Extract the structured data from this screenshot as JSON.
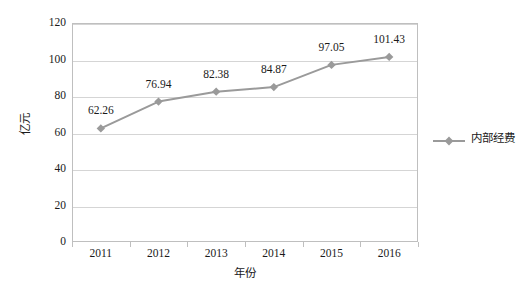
{
  "chart_data": {
    "type": "line",
    "title": "",
    "subtitle": "",
    "xlabel": "年份",
    "ylabel": "亿元",
    "categories": [
      "2011",
      "2012",
      "2013",
      "2014",
      "2015",
      "2016"
    ],
    "series": [
      {
        "name": "内部经费",
        "values": [
          62.26,
          76.94,
          82.38,
          84.87,
          97.05,
          101.43
        ],
        "point_labels": [
          "62.26",
          "76.94",
          "82.38",
          "84.87",
          "97.05",
          "101.43"
        ],
        "color": "#9a9a9a",
        "marker": "diamond"
      }
    ],
    "ylim": [
      0,
      120
    ],
    "y_ticks": [
      0,
      20,
      40,
      60,
      80,
      100,
      120
    ],
    "y_tick_labels": [
      "0",
      "20",
      "40",
      "60",
      "80",
      "100",
      "120"
    ],
    "grid": "horizontal",
    "legend_position": "right",
    "colors": {
      "series": "#9a9a9a",
      "gridline": "#d5d5d5",
      "axis": "#bfbfbf",
      "text": "#1a1a1a",
      "background": "#ffffff"
    }
  },
  "legend": {
    "entries": [
      {
        "label": "内部经费",
        "color": "#9a9a9a",
        "marker": "diamond"
      }
    ]
  }
}
